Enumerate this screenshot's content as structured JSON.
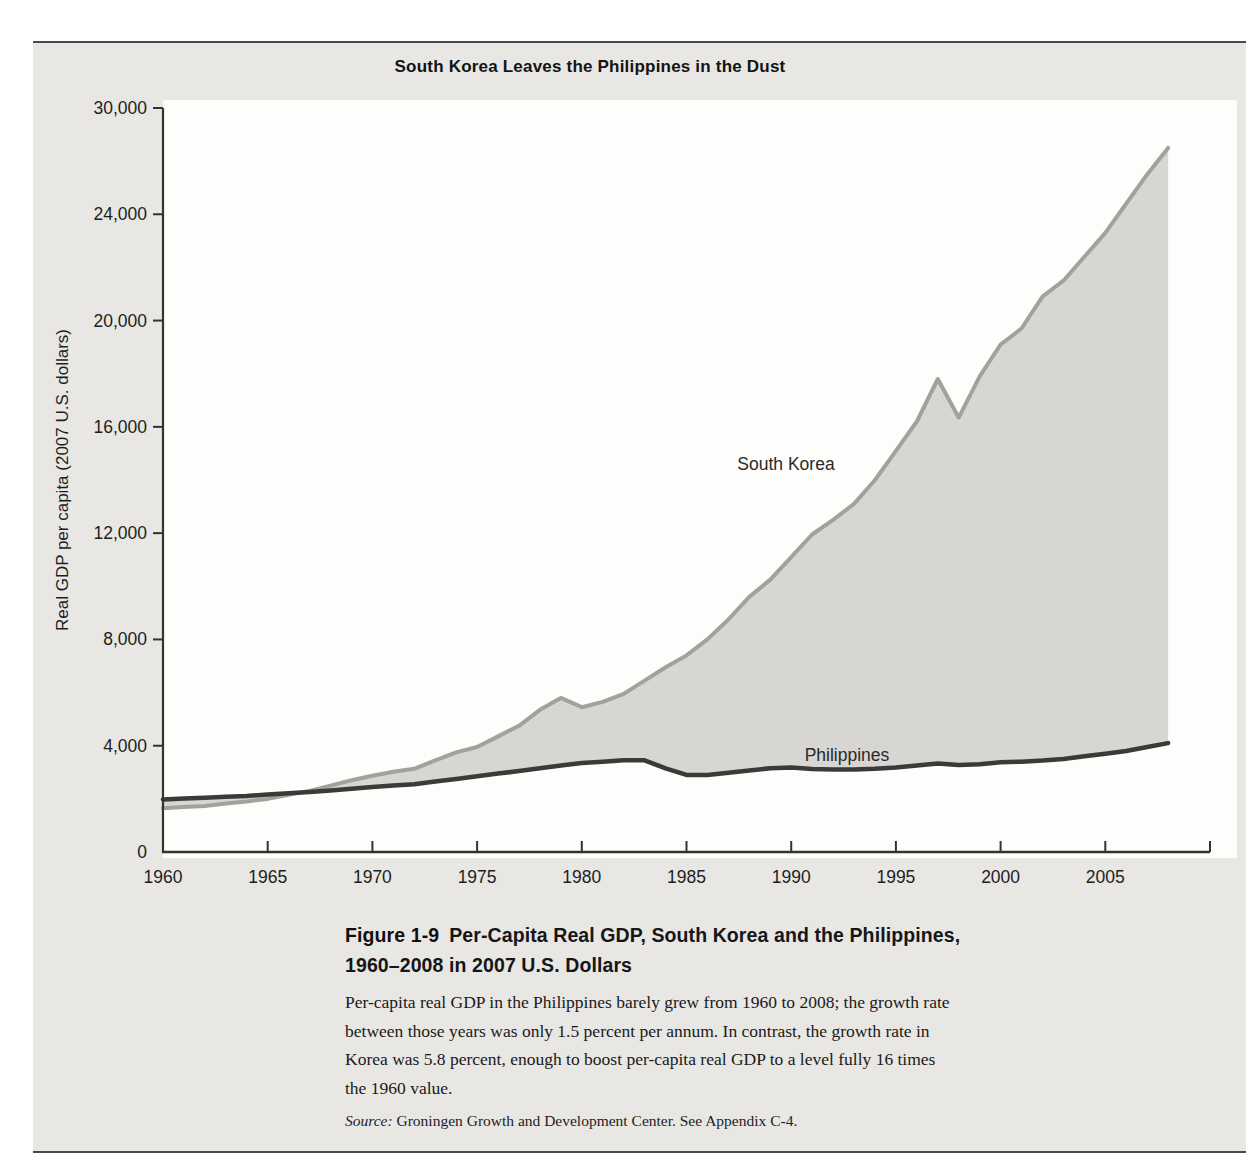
{
  "figure": {
    "title": "South Korea Leaves the Philippines in the Dust",
    "y_axis_label": "Real GDP per capita (2007 U.S. dollars)"
  },
  "caption": {
    "figure_label": "Figure 1-9",
    "heading_line1": "Per-Capita Real GDP, South Korea and the Philippines,",
    "heading_line2": "1960–2008 in 2007 U.S. Dollars",
    "body_lines": [
      "Per-capita real GDP in the Philippines barely grew from 1960 to 2008; the growth rate",
      "between those years was only 1.5 percent per annum. In contrast, the growth rate in",
      "Korea was 5.8 percent, enough to boost per-capita real GDP to a level fully 16 times",
      "the 1960 value."
    ],
    "source_label": "Source:",
    "source_text": " Groningen Growth and Development Center. See Appendix C-4."
  },
  "colors": {
    "panel_bg": "#e8e7e4",
    "plot_bg": "#fdfdfb",
    "area_fill": "#d7d6d3",
    "south_korea_line": "#a2a19e",
    "philippines_line": "#3a3a38",
    "axis": "#333331",
    "text": "#1e1e1e"
  },
  "chart_data": {
    "type": "area",
    "title": "South Korea Leaves the Philippines in the Dust",
    "xlabel": "",
    "ylabel": "Real GDP per capita (2007 U.S. dollars)",
    "xlim": [
      1960,
      2010
    ],
    "ylim": [
      0,
      28000
    ],
    "grid": false,
    "legend_position": "inline-labels",
    "note": "Printed figure labels the top tick 30,000 although it sits at the evenly spaced 28,000 position",
    "x_ticks": [
      {
        "year": 1960,
        "label": "1960",
        "tick": false
      },
      {
        "year": 1965,
        "label": "1965",
        "tick": true
      },
      {
        "year": 1970,
        "label": "1970",
        "tick": true
      },
      {
        "year": 1975,
        "label": "1975",
        "tick": true
      },
      {
        "year": 1980,
        "label": "1980",
        "tick": true
      },
      {
        "year": 1985,
        "label": "1985",
        "tick": true
      },
      {
        "year": 1990,
        "label": "1990",
        "tick": true
      },
      {
        "year": 1995,
        "label": "1995",
        "tick": true
      },
      {
        "year": 2000,
        "label": "2000",
        "tick": true
      },
      {
        "year": 2005,
        "label": "2005",
        "tick": true
      },
      {
        "year": 2010,
        "label": "",
        "tick": true
      }
    ],
    "y_ticks": [
      {
        "value": 0,
        "label": "0",
        "tick": false
      },
      {
        "value": 4000,
        "label": "4,000",
        "tick": true
      },
      {
        "value": 8000,
        "label": "8,000",
        "tick": true
      },
      {
        "value": 12000,
        "label": "12,000",
        "tick": true
      },
      {
        "value": 16000,
        "label": "16,000",
        "tick": true
      },
      {
        "value": 20000,
        "label": "20,000",
        "tick": true
      },
      {
        "value": 24000,
        "label": "24,000",
        "tick": true
      },
      {
        "value": 28000,
        "label": "30,000",
        "tick": true
      }
    ],
    "years": [
      1960,
      1961,
      1962,
      1963,
      1964,
      1965,
      1966,
      1967,
      1968,
      1969,
      1970,
      1971,
      1972,
      1973,
      1974,
      1975,
      1976,
      1977,
      1978,
      1979,
      1980,
      1981,
      1982,
      1983,
      1984,
      1985,
      1986,
      1987,
      1988,
      1989,
      1990,
      1991,
      1992,
      1993,
      1994,
      1995,
      1996,
      1997,
      1998,
      1999,
      2000,
      2001,
      2002,
      2003,
      2004,
      2005,
      2006,
      2007,
      2008
    ],
    "series": [
      {
        "name": "South Korea",
        "values": [
          1650,
          1690,
          1730,
          1820,
          1900,
          2000,
          2150,
          2300,
          2500,
          2700,
          2870,
          3020,
          3130,
          3450,
          3750,
          3950,
          4350,
          4750,
          5350,
          5800,
          5450,
          5650,
          5950,
          6450,
          6950,
          7400,
          8000,
          8750,
          9600,
          10250,
          11100,
          11950,
          12500,
          13100,
          14000,
          15100,
          16200,
          17800,
          16350,
          17900,
          19100,
          19700,
          20900,
          21500,
          22400,
          23300,
          24400,
          25500,
          26500
        ]
      },
      {
        "name": "Philippines",
        "values": [
          1980,
          2010,
          2040,
          2080,
          2110,
          2160,
          2210,
          2260,
          2320,
          2380,
          2450,
          2500,
          2550,
          2650,
          2750,
          2850,
          2950,
          3050,
          3150,
          3250,
          3350,
          3400,
          3450,
          3450,
          3150,
          2900,
          2900,
          2980,
          3070,
          3150,
          3180,
          3120,
          3100,
          3100,
          3130,
          3180,
          3250,
          3330,
          3270,
          3300,
          3380,
          3400,
          3440,
          3500,
          3600,
          3700,
          3800,
          3950,
          4100
        ]
      }
    ]
  }
}
